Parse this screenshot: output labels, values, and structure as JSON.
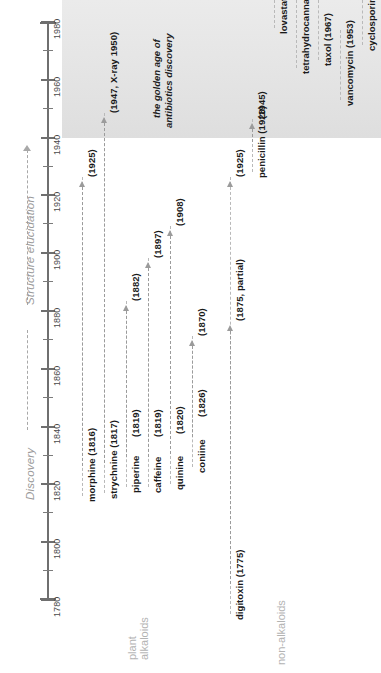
{
  "figure": {
    "axis": {
      "name": "year-axis",
      "min": 1780,
      "max": 1980,
      "label_step": 20,
      "tick_step": 10,
      "labels": [
        "1780",
        "1800",
        "1820",
        "1840",
        "1860",
        "1880",
        "1900",
        "1920",
        "1940",
        "1960",
        "1980"
      ]
    },
    "captions": {
      "discovery": "Discovery",
      "structure": "Structure elucidation"
    },
    "groups": {
      "alkaloids_line1": "plant",
      "alkaloids_line2": "alkaloids",
      "non_alkaloids": "non-alkaloids"
    },
    "band": {
      "name": "golden-age-band",
      "start_year": 1940,
      "end_year": 1985,
      "color": "#e6e6e6",
      "annotation_line1": "the golden age of",
      "annotation_line2": "antibiotics discovery"
    }
  },
  "chart_data": {
    "type": "timeline",
    "xlabel": "",
    "ylabel": "",
    "ylim": [
      1780,
      1985
    ],
    "grid": false,
    "legend": "none",
    "orientation": "vertical-rotated",
    "series": [
      {
        "name": "morphine",
        "group": "plant alkaloids",
        "discovery_label": "morphine (1816)",
        "discovery_year": 1816,
        "structure_label": "(1925)",
        "structure_year": 1925
      },
      {
        "name": "strychnine",
        "group": "plant alkaloids",
        "discovery_label": "strychnine (1817)",
        "discovery_year": 1817,
        "structure_label": "(1947, X-ray 1950)",
        "structure_year": 1947
      },
      {
        "name": "piperine",
        "group": "plant alkaloids",
        "discovery_label": "piperine",
        "discovery_year_label": "(1819)",
        "discovery_year": 1819,
        "structure_label": "(1882)",
        "structure_year": 1882
      },
      {
        "name": "caffeine",
        "group": "plant alkaloids",
        "discovery_label": "caffeine",
        "discovery_year_label": "(1819)",
        "discovery_year": 1819,
        "structure_label": "(1897)",
        "structure_year": 1897
      },
      {
        "name": "quinine",
        "group": "plant alkaloids",
        "discovery_label": "quinine",
        "discovery_year_label": "(1820)",
        "discovery_year": 1820,
        "structure_label": "(1908)",
        "structure_year": 1908
      },
      {
        "name": "coniine",
        "group": "plant alkaloids",
        "discovery_label": "coniine",
        "discovery_year_label": "(1826)",
        "discovery_year": 1826,
        "structure_label": "(1870)",
        "structure_year": 1870
      },
      {
        "name": "digitoxin",
        "group": "non-alkaloids",
        "discovery_label": "digitoxin (1775)",
        "discovery_year": 1775,
        "structure_label": "(1875, partial)",
        "structure_year": 1875,
        "structure_label_2": "(1925)",
        "structure_year_2": 1925
      },
      {
        "name": "penicillin",
        "group": "non-alkaloids",
        "discovery_label": "penicillin (1928)",
        "discovery_year": 1928,
        "structure_label": "(1945)",
        "structure_year": 1945
      },
      {
        "name": "lovastatin",
        "group": "non-alkaloids",
        "discovery_label": "lovastatin (1978)",
        "discovery_year": 1978
      },
      {
        "name": "tetrahydrocannabinol",
        "group": "non-alkaloids",
        "discovery_label": "tetrahydrocannabinol (1964)",
        "discovery_year": 1964
      },
      {
        "name": "taxol",
        "group": "non-alkaloids",
        "discovery_label": "taxol (1967)",
        "discovery_year": 1967
      },
      {
        "name": "vancomycin",
        "group": "non-alkaloids",
        "discovery_label": "vancomycin (1953)",
        "discovery_year": 1953
      },
      {
        "name": "cyclosporine",
        "group": "non-alkaloids",
        "discovery_label": "cyclosporine (1972)",
        "discovery_year": 1972
      }
    ]
  }
}
